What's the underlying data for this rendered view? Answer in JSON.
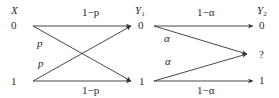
{
  "diagram": {
    "type": "cascaded-channel",
    "colors": {
      "line": "#333333",
      "text": "#2a2a2a",
      "background": "#ffffff"
    },
    "stage1": {
      "input_label": "X",
      "output_label": "Y",
      "output_subscript": "1",
      "inputs": [
        "0",
        "1"
      ],
      "outputs": [
        "0",
        "1"
      ],
      "edges": [
        {
          "from": "0",
          "to": "0",
          "label": "1−p"
        },
        {
          "from": "0",
          "to": "1",
          "label": "p"
        },
        {
          "from": "1",
          "to": "0",
          "label": "p"
        },
        {
          "from": "1",
          "to": "1",
          "label": "1−p"
        }
      ]
    },
    "stage2": {
      "output_label": "Y",
      "output_subscript": "2",
      "outputs": [
        "0",
        "?",
        "1"
      ],
      "edges": [
        {
          "from": "0",
          "to": "0",
          "label": "1−α"
        },
        {
          "from": "0",
          "to": "?",
          "label": "α"
        },
        {
          "from": "1",
          "to": "?",
          "label": "α"
        },
        {
          "from": "1",
          "to": "1",
          "label": "1−α"
        }
      ]
    }
  },
  "labels": {
    "x_var": "X",
    "y_var": "Y",
    "y1_sub": "1",
    "y2_sub": "2",
    "x0": "0",
    "x1": "1",
    "y1_0": "0",
    "y1_1": "1",
    "y2_0": "0",
    "y2_q": "?",
    "y2_1": "1",
    "top_1mp": "1−p",
    "bottom_1mp": "1−p",
    "cross_p_top": "p",
    "cross_p_bottom": "p",
    "top_1ma": "1−α",
    "bottom_1ma": "1−α",
    "alpha_top": "α",
    "alpha_bottom": "α"
  }
}
